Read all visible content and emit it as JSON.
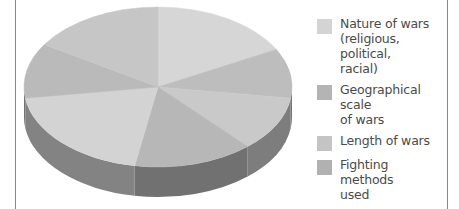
{
  "chart_data": {
    "type": "pie",
    "style": "3d",
    "title": "",
    "legend_position": "right",
    "categories": [
      "Nature of wars (religious, political, racial)",
      "Geographical scale of wars",
      "Length of wars",
      "Fighting methods used",
      "Forming armies"
    ],
    "slices": [
      {
        "start": -90,
        "end": -28,
        "color": "#d6d6d6"
      },
      {
        "start": -28,
        "end": 8,
        "color": "#bdbdbd"
      },
      {
        "start": 8,
        "end": 48,
        "color": "#c9c9c9"
      },
      {
        "start": 48,
        "end": 100,
        "color": "#b7b7b7"
      },
      {
        "start": 100,
        "end": 172,
        "color": "#d3d3d3"
      },
      {
        "start": 172,
        "end": 212,
        "color": "#bababa"
      },
      {
        "start": 212,
        "end": 270,
        "color": "#c6c6c6"
      }
    ]
  },
  "legend": {
    "items": [
      {
        "label": "Nature of wars (religious, political, racial)",
        "lines": [
          "Nature of wars",
          "(religious, political,",
          "racial)"
        ],
        "color": "#d4d4d4"
      },
      {
        "label": "Geographical scale of wars",
        "lines": [
          "Geographical scale",
          "of wars"
        ],
        "color": "#b4b4b4"
      },
      {
        "label": "Length of wars",
        "lines": [
          "Length of wars"
        ],
        "color": "#c4c4c4"
      },
      {
        "label": "Fighting methods used",
        "lines": [
          "Fighting methods",
          "used"
        ],
        "color": "#b1b1b1"
      },
      {
        "label": "Forming armies",
        "lines": [
          "Forming armies"
        ],
        "color": "#cfcfcf"
      }
    ]
  }
}
